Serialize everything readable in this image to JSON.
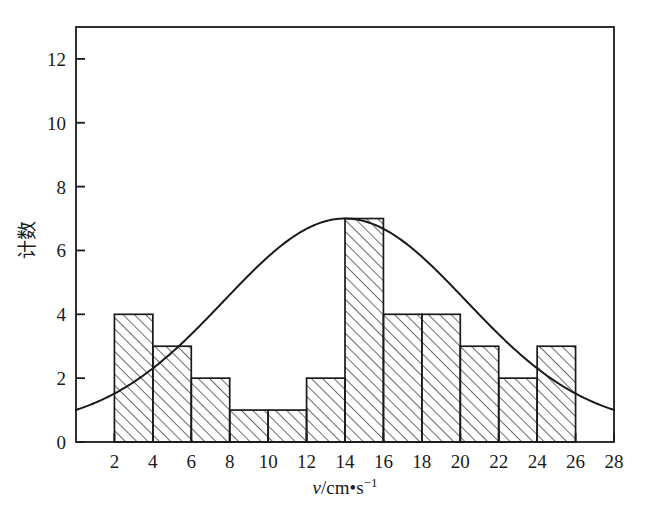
{
  "chart_data": {
    "type": "bar",
    "title": "",
    "subtitle": "",
    "xlabel": "v/cm•s⁻¹",
    "xlabel_parts": {
      "variable": "v",
      "rest": "/cm•s",
      "exponent": "−1"
    },
    "ylabel": "计数",
    "xlim": [
      0,
      28
    ],
    "ylim": [
      0,
      13
    ],
    "grid": false,
    "legend": null,
    "bin_edges": [
      2,
      4,
      6,
      8,
      10,
      12,
      14,
      16,
      18,
      20,
      22,
      24,
      26
    ],
    "categories": [
      "2-4",
      "4-6",
      "6-8",
      "8-10",
      "10-12",
      "12-14",
      "14-16",
      "16-18",
      "18-20",
      "20-22",
      "22-24",
      "24-26"
    ],
    "values": [
      4,
      3,
      2,
      1,
      1,
      2,
      7,
      4,
      4,
      3,
      2,
      3
    ],
    "bar_style": "diagonal-hatch",
    "xticks": [
      2,
      4,
      6,
      8,
      10,
      12,
      14,
      16,
      18,
      20,
      22,
      24,
      26,
      28
    ],
    "xtick_labels": [
      "2",
      "4",
      "6",
      "8",
      "10",
      "12",
      "14",
      "16",
      "18",
      "20",
      "22",
      "24",
      "26",
      "28"
    ],
    "yticks": [
      0,
      2,
      4,
      6,
      8,
      10,
      12
    ],
    "ytick_labels": [
      "0",
      "2",
      "4",
      "6",
      "8",
      "10",
      "12"
    ],
    "overlay_curve": {
      "type": "line",
      "name": "gaussian-fit",
      "mean": 14.0,
      "peak": 7.0,
      "sigma": 6.3,
      "baseline": 0.45,
      "x_start": 0,
      "x_end": 28,
      "endpoint_values": [
        0.95,
        0.95
      ]
    },
    "colors": {
      "axis": "#1a1a1a",
      "bar_outline": "#1a1a1a",
      "bar_hatch": "#3a3a3a",
      "curve": "#1a1a1a",
      "background": "#ffffff"
    }
  }
}
